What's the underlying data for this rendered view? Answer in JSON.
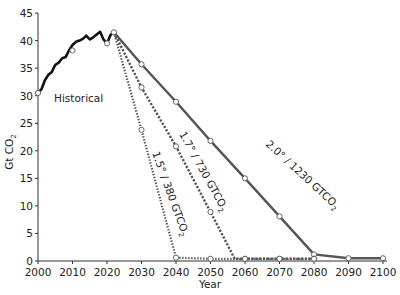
{
  "chart_data": {
    "type": "line",
    "title": "",
    "xlabel": "Year",
    "ylabel": "Gt CO₂",
    "xlim": [
      2000,
      2100
    ],
    "ylim": [
      0,
      45
    ],
    "grid": false,
    "legend": "none (inline annotations)",
    "x_ticks": [
      2000,
      2010,
      2020,
      2030,
      2040,
      2050,
      2060,
      2070,
      2080,
      2090,
      2100
    ],
    "y_ticks": [
      0,
      5,
      10,
      15,
      20,
      25,
      30,
      35,
      40,
      45
    ],
    "series": [
      {
        "name": "Historical",
        "style": "solid-black-thick",
        "color": "#111111",
        "x": [
          2000,
          2001,
          2002,
          2003,
          2004,
          2005,
          2006,
          2007,
          2008,
          2009,
          2010,
          2011,
          2012,
          2013,
          2014,
          2015,
          2016,
          2017,
          2018,
          2019,
          2020,
          2021,
          2022
        ],
        "values": [
          30.5,
          31.2,
          32.8,
          33.8,
          34.3,
          35.6,
          36.0,
          36.8,
          37.0,
          38.2,
          39.2,
          39.8,
          40.0,
          40.3,
          40.9,
          40.2,
          40.6,
          41.1,
          41.6,
          40.2,
          39.5,
          41.0,
          41.5
        ],
        "markers": [
          {
            "x": 2000,
            "y": 30.5
          },
          {
            "x": 2010,
            "y": 38.2
          },
          {
            "x": 2020,
            "y": 39.5
          },
          {
            "x": 2022,
            "y": 41.5
          }
        ]
      },
      {
        "name": "2.0° / 1230 GTCO₂",
        "style": "solid-gray",
        "color": "#555555",
        "x": [
          2022,
          2030,
          2040,
          2050,
          2060,
          2070,
          2080,
          2090,
          2100
        ],
        "values": [
          41.5,
          35.7,
          28.9,
          21.8,
          15.0,
          8.1,
          1.2,
          0.5,
          0.5
        ]
      },
      {
        "name": "1.7° / 730 GTCO₂",
        "style": "dashed-gray",
        "color": "#555555",
        "x": [
          2022,
          2030,
          2040,
          2050,
          2057,
          2060,
          2070,
          2080
        ],
        "values": [
          41.5,
          31.5,
          20.8,
          8.9,
          0.4,
          0.4,
          0.4,
          0.4
        ]
      },
      {
        "name": "1.5° / 380 GTCO₂",
        "style": "dotted-gray",
        "color": "#555555",
        "x": [
          2022,
          2030,
          2040,
          2050,
          2060,
          2070,
          2080
        ],
        "values": [
          41.5,
          23.8,
          0.6,
          0.4,
          0.4,
          0.4,
          0.4
        ]
      }
    ],
    "annotations": [
      {
        "text": "Historical",
        "x": 2008,
        "y": 34
      },
      {
        "text": "2.0° / 1230 GTCO₂",
        "along": "2.0° line"
      },
      {
        "text": "1.7° / 730 GTCO₂",
        "along": "1.7° line"
      },
      {
        "text": "1.5° / 380 GTCO₂",
        "along": "1.5° line"
      }
    ]
  },
  "labels": {
    "xlabel": "Year",
    "ylabel": "Gt CO",
    "ylabel_sub": "2",
    "historical": "Historical",
    "s20": "2.0° / 1230 GTCO",
    "s17": "1.7° / 730 GTCO",
    "s15": "1.5° / 380 GTCO",
    "sub2": "2"
  }
}
